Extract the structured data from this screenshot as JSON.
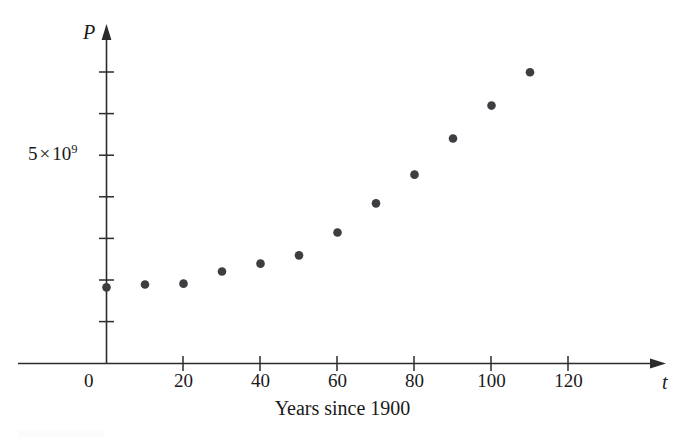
{
  "figure": {
    "x_axis_caption": "Years since 1900",
    "x_axis_variable": "t",
    "y_axis_variable": "P",
    "origin_label": "0",
    "y_tick_label_mantissa": "5",
    "y_tick_label_times": "×",
    "y_tick_label_base": "10",
    "y_tick_label_exponent": "9",
    "point_color": "#3d3d42",
    "axis_color": "#2b2b2b",
    "background_color": "#ffffff"
  },
  "chart_data": {
    "type": "scatter",
    "title": "",
    "xlabel": "Years since 1900",
    "ylabel": "P",
    "x": [
      0,
      10,
      20,
      30,
      40,
      50,
      60,
      70,
      80,
      90,
      100,
      110
    ],
    "values": [
      1830000000,
      1900000000,
      1920000000,
      2210000000,
      2400000000,
      2600000000,
      3150000000,
      3850000000,
      4540000000,
      5410000000,
      6200000000,
      7000000000
    ],
    "xlim": [
      0,
      130
    ],
    "ylim": [
      0,
      7600000000
    ],
    "xticks": [
      0,
      20,
      40,
      60,
      80,
      100,
      120
    ],
    "xticklabels": [
      "0",
      "20",
      "40",
      "60",
      "80",
      "100",
      "120"
    ],
    "yticks": [
      1000000000,
      2000000000,
      3000000000,
      4000000000,
      5000000000,
      6000000000,
      7000000000
    ],
    "yticklabels": [
      "",
      "",
      "",
      "",
      "5 × 10⁹",
      "",
      ""
    ],
    "grid": false,
    "legend": null,
    "marker": "circle",
    "marker_color": "#3d3d42"
  }
}
